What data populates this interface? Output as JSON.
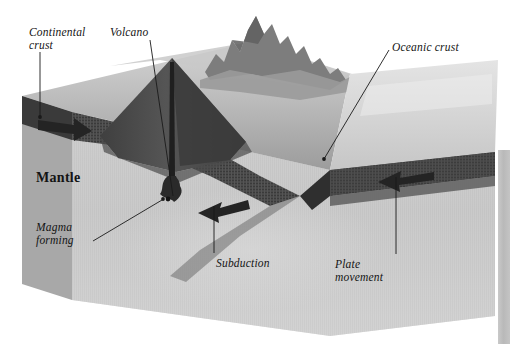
{
  "figure": {
    "kind": "block-diagram",
    "canvas": {
      "width": 510,
      "height": 344
    },
    "background_color": "#ffffff"
  },
  "palette": {
    "continental_crust_band": "#3d3d3d",
    "oceanic_crust_band": "#4a4a4a",
    "mantle_body": "#b5b5b5",
    "mantle_front_face": "#c8c8c8",
    "ocean_surface": "#dcdcdc",
    "volcano_cone": "#4f4f4f",
    "mountains": "#8e8e8e",
    "arrow_fill": "#2b2b2b",
    "leader_line": "#1a1a1a",
    "label_text": "#141414"
  },
  "labels": [
    {
      "id": "continental-crust",
      "lines": [
        "Continental",
        "crust"
      ],
      "style": "italic",
      "leader": {
        "from": [
          40,
          54
        ],
        "to": [
          40,
          117
        ],
        "tip": "dot"
      }
    },
    {
      "id": "volcano",
      "lines": [
        "Volcano"
      ],
      "style": "italic",
      "leader": {
        "from": [
          150,
          40
        ],
        "to": [
          174,
          196
        ],
        "tip": "none"
      }
    },
    {
      "id": "oceanic-crust",
      "lines": [
        "Oceanic crust"
      ],
      "style": "italic",
      "leader": {
        "from": [
          390,
          50
        ],
        "to": [
          323,
          160
        ],
        "tip": "dot"
      }
    },
    {
      "id": "mantle",
      "lines": [
        "Mantle"
      ],
      "style": "roman-bold",
      "leader": null
    },
    {
      "id": "magma-forming",
      "lines": [
        "Magma",
        "forming"
      ],
      "style": "italic",
      "leader": {
        "from": [
          92,
          240
        ],
        "to": [
          161,
          199
        ],
        "tip": "dot"
      }
    },
    {
      "id": "subduction",
      "lines": [
        "Subduction"
      ],
      "style": "italic",
      "leader": {
        "from": [
          214,
          253
        ],
        "to": [
          214,
          205
        ],
        "tip": "none"
      }
    },
    {
      "id": "plate-movement",
      "lines": [
        "Plate",
        "movement"
      ],
      "style": "italic",
      "leader": {
        "from": [
          396,
          255
        ],
        "to": [
          396,
          176
        ],
        "tip": "none"
      }
    }
  ],
  "arrows": [
    {
      "id": "continental-plate-arrow",
      "direction": "right",
      "at": [
        58,
        124
      ],
      "meaning": "continental plate movement"
    },
    {
      "id": "subduction-arrow",
      "direction": "left-down",
      "at": [
        222,
        215
      ],
      "meaning": "subducting slab direction"
    },
    {
      "id": "oceanic-plate-arrow",
      "direction": "left",
      "at": [
        398,
        182
      ],
      "meaning": "oceanic plate movement"
    }
  ],
  "features": [
    {
      "id": "volcano-cone",
      "description": "dark conical volcano on continental crust"
    },
    {
      "id": "mountain-range",
      "description": "jagged peaks along continental margin"
    },
    {
      "id": "magma-conduit",
      "description": "vertical pipe from magma chamber to volcano summit"
    },
    {
      "id": "magma-chamber",
      "description": "magma body forming above subducting slab"
    },
    {
      "id": "ocean-surface",
      "description": "flat pale sea surface over oceanic crust"
    },
    {
      "id": "trench",
      "description": "depression where oceanic plate dives beneath continental plate"
    }
  ],
  "edge_strip": {
    "present": true,
    "description": "narrow gray page sliver at right margin"
  }
}
